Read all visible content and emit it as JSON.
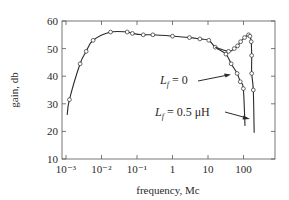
{
  "chart_data": {
    "type": "line",
    "title": "",
    "xlabel": "frequency, Mc",
    "ylabel": "gain, db",
    "xscale": "log",
    "xlim": [
      0.0007,
      400
    ],
    "ylim": [
      10,
      60
    ],
    "x_ticks": [
      0.001,
      0.01,
      0.1,
      1,
      10,
      100
    ],
    "x_tick_labels": [
      "10⁻³",
      "10⁻²",
      "10⁻¹",
      "1",
      "10",
      "100"
    ],
    "y_ticks": [
      10,
      20,
      30,
      40,
      50,
      60
    ],
    "y_tick_labels": [
      "10",
      "20",
      "30",
      "40",
      "50",
      "60"
    ],
    "grid": false,
    "legend": null,
    "series": [
      {
        "name": "L_f = 0",
        "x": [
          0.00108,
          0.00125,
          0.0025,
          0.0037,
          0.0058,
          0.018,
          0.053,
          0.074,
          0.15,
          0.28,
          1.0,
          3.0,
          5.9,
          10.5,
          16,
          32,
          45,
          66,
          81,
          99,
          110
        ],
        "y": [
          26,
          31.5,
          44.5,
          49,
          53,
          56,
          56,
          55.5,
          55,
          55,
          54.5,
          54,
          53.5,
          53,
          50.5,
          48,
          44.5,
          41,
          38,
          35.5,
          22
        ],
        "markers": true
      },
      {
        "name": "L_f = 0.5 μH",
        "x": [
          16,
          38,
          55,
          68,
          83,
          107,
          139,
          152,
          165,
          170,
          170,
          189,
          200
        ],
        "y": [
          50.5,
          49,
          50,
          51,
          52.5,
          54,
          55,
          54.5,
          52.5,
          47.5,
          41,
          35,
          19.5
        ],
        "markers": true
      }
    ],
    "annotations": [
      {
        "text": "L_f = 0",
        "arrow_to_series": "L_f = 0"
      },
      {
        "text": "L_f = 0.5 μH",
        "arrow_to_series": "L_f = 0.5 μH"
      }
    ]
  },
  "labels": {
    "xlabel": "frequency, Mc",
    "ylabel": "gain, db",
    "annot1_main": "L",
    "annot1_sub": "f",
    "annot1_rest": " = 0",
    "annot2_main": "L",
    "annot2_sub": "f",
    "annot2_rest": " = 0.5 μH"
  }
}
